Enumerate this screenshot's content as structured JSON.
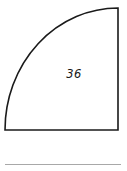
{
  "figure": {
    "name": "quarter-circle-area-figure",
    "shape_type": "quarter-circle",
    "area_label": "36",
    "geometry": {
      "bottom_left": [
        5,
        130
      ],
      "bottom_right": [
        118,
        130
      ],
      "top_right": [
        118,
        8
      ],
      "arc_center": [
        118,
        130
      ],
      "arc_radius_x": 113,
      "arc_radius_y": 122,
      "arc_sweep_degrees": 90
    },
    "label_position": [
      74,
      78
    ]
  },
  "style": {
    "background_color": "#ffffff",
    "outline_color": "#1a1a1a",
    "outline_width_px": 1.6,
    "label_color": "#1a1a1a",
    "rule_color": "#a8a8a8"
  },
  "footer": {
    "rule_present": true,
    "rule_left_px": 5,
    "rule_top_px": 164,
    "rule_width_px": 116
  }
}
